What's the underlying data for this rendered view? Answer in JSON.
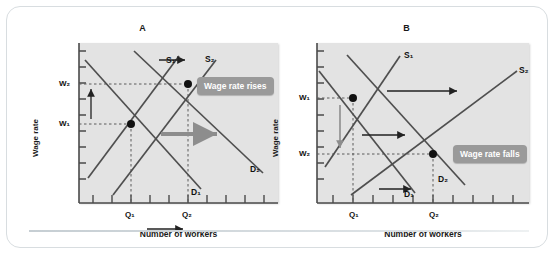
{
  "figure": {
    "panels": [
      {
        "id": "A",
        "title": "A",
        "callout": "Wage rate rises",
        "axis_x_label": "Number of workers",
        "axis_y_label": "Wage rate",
        "y_ticks": [
          "W₂",
          "W₁"
        ],
        "x_ticks": [
          "Q₁",
          "Q₂"
        ],
        "curves": [
          {
            "name": "S₁",
            "label": "S₁"
          },
          {
            "name": "S₂",
            "label": "S₂"
          },
          {
            "name": "D₁",
            "label": "D₁"
          },
          {
            "name": "D₂",
            "label": "D₂"
          }
        ]
      },
      {
        "id": "B",
        "title": "B",
        "callout": "Wage rate falls",
        "axis_x_label": "Number of workers",
        "axis_y_label": "Wage rate",
        "y_ticks": [
          "W₁",
          "W₂"
        ],
        "x_ticks": [
          "Q₁",
          "Q₂"
        ],
        "curves": [
          {
            "name": "S₁",
            "label": "S₁"
          },
          {
            "name": "S₂",
            "label": "S₂"
          },
          {
            "name": "D₁",
            "label": "D₁"
          },
          {
            "name": "D₂",
            "label": "D₂"
          }
        ]
      }
    ]
  },
  "chart_data": [
    {
      "type": "line",
      "title": "A",
      "xlabel": "Number of workers",
      "ylabel": "Wage rate",
      "annotation": "Wage rate rises",
      "xlim": [
        0,
        10
      ],
      "ylim": [
        0,
        10
      ],
      "grid": false,
      "legend": "inline-curve-labels",
      "series": [
        {
          "name": "S₁",
          "type": "supply",
          "x": [
            1.2,
            5.3
          ],
          "y": [
            1.6,
            9.2
          ]
        },
        {
          "name": "S₂",
          "type": "supply",
          "x": [
            2.4,
            6.9
          ],
          "y": [
            0.6,
            9.0
          ]
        },
        {
          "name": "D₁",
          "type": "demand",
          "x": [
            1.0,
            6.2
          ],
          "y": [
            9.0,
            1.1
          ]
        },
        {
          "name": "D₂",
          "type": "demand",
          "x": [
            2.6,
            9.2
          ],
          "y": [
            9.6,
            2.4
          ]
        }
      ],
      "equilibria": [
        {
          "label": "E₁",
          "x": 3.1,
          "y": 5.1,
          "x_tick": "Q₁",
          "y_tick": "W₁"
        },
        {
          "label": "E₂",
          "x": 6.0,
          "y": 7.4,
          "x_tick": "Q₂",
          "y_tick": "W₂"
        }
      ],
      "shift_arrows": [
        {
          "from": "S₁",
          "to": "S₂",
          "direction": "right"
        },
        {
          "from": "D₁",
          "to": "D₂",
          "direction": "right"
        },
        {
          "from": "W₁",
          "to": "W₂",
          "direction": "up"
        },
        {
          "from": "Q₁",
          "to": "Q₂",
          "direction": "right"
        }
      ]
    },
    {
      "type": "line",
      "title": "B",
      "xlabel": "Number of workers",
      "ylabel": "Wage rate",
      "annotation": "Wage rate falls",
      "xlim": [
        0,
        10
      ],
      "ylim": [
        0,
        10
      ],
      "grid": false,
      "legend": "inline-curve-labels",
      "series": [
        {
          "name": "S₁",
          "type": "supply",
          "x": [
            1.0,
            4.3
          ],
          "y": [
            2.0,
            9.2
          ]
        },
        {
          "name": "S₂",
          "type": "supply",
          "x": [
            2.3,
            9.3
          ],
          "y": [
            0.7,
            8.0
          ]
        },
        {
          "name": "D₁",
          "type": "demand",
          "x": [
            0.6,
            5.2
          ],
          "y": [
            8.3,
            1.0
          ]
        },
        {
          "name": "D₂",
          "type": "demand",
          "x": [
            2.0,
            7.0
          ],
          "y": [
            9.4,
            2.2
          ]
        }
      ],
      "equilibria": [
        {
          "label": "E₁",
          "x": 1.9,
          "y": 6.4,
          "x_tick": "Q₁",
          "y_tick": "W₁"
        },
        {
          "label": "E₂",
          "x": 5.9,
          "y": 3.1,
          "x_tick": "Q₂",
          "y_tick": "W₂"
        }
      ],
      "shift_arrows": [
        {
          "from": "S₁",
          "to": "S₂",
          "direction": "right"
        },
        {
          "from": "D₁",
          "to": "D₂",
          "direction": "right"
        },
        {
          "from": "W₁",
          "to": "W₂",
          "direction": "down"
        },
        {
          "from": "Q₁",
          "to": "Q₂",
          "direction": "right"
        }
      ]
    }
  ]
}
